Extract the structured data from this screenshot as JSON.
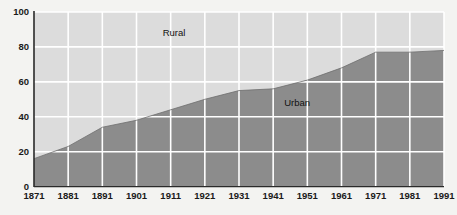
{
  "chart_data": {
    "type": "area",
    "title": "",
    "subtitle": "",
    "xlabel": "",
    "ylabel": "",
    "xlim": [
      1871,
      1991
    ],
    "ylim": [
      0,
      100
    ],
    "grid": true,
    "legend_position": "inline-annotations",
    "x": [
      1871,
      1881,
      1891,
      1901,
      1911,
      1921,
      1931,
      1941,
      1951,
      1961,
      1971,
      1981,
      1991
    ],
    "x_tick_labels": [
      "1871",
      "1881",
      "1891",
      "1901",
      "1911",
      "1921",
      "1931",
      "1941",
      "1951",
      "1961",
      "1971",
      "1981",
      "1991"
    ],
    "y_tick_labels": [
      "0",
      "20",
      "40",
      "60",
      "80",
      "100"
    ],
    "y_ticks": [
      0,
      20,
      40,
      60,
      80,
      100
    ],
    "series": [
      {
        "name": "Urban",
        "values": [
          16,
          23,
          34,
          38,
          44,
          50,
          55,
          56,
          61,
          68,
          77,
          77,
          78
        ],
        "color": "#8c8c8c",
        "annotation": "Urban",
        "annotation_x": 1948,
        "annotation_y": 46
      },
      {
        "name": "Rural",
        "values": [
          84,
          77,
          66,
          62,
          56,
          50,
          45,
          44,
          39,
          32,
          23,
          23,
          22
        ],
        "color": "#dcdcdc",
        "annotation": "Rural",
        "annotation_x": 1912,
        "annotation_y": 86
      }
    ],
    "annotations": [
      {
        "text": "Rural",
        "x": 1912,
        "y": 86
      },
      {
        "text": "Urban",
        "x": 1948,
        "y": 46
      }
    ],
    "colors": {
      "urban_fill": "#8c8c8c",
      "rural_fill": "#dcdcdc",
      "gridline": "#ffffff",
      "axis": "#2a2a2a",
      "background": "#f3f3f1",
      "text": "#1a1a1a"
    }
  }
}
